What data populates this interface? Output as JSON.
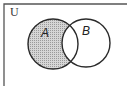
{
  "diagram": {
    "type": "venn",
    "universe_label": "U",
    "sets": [
      {
        "label": "A",
        "cx": 53,
        "cy": 44,
        "r": 25
      },
      {
        "label": "B",
        "cx": 86,
        "cy": 43,
        "r": 24
      }
    ],
    "shaded_region": "A - B",
    "colors": {
      "stroke": "#2a2a2a",
      "shade": "#c8c8c8",
      "frame": "#555555",
      "background": "#ffffff"
    }
  }
}
